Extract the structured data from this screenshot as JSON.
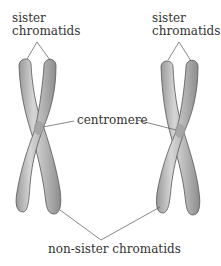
{
  "diagram": {
    "labels": {
      "sister_left_line1": "sister",
      "sister_left_line2": "chromatids",
      "sister_right_line1": "sister",
      "sister_right_line2": "chromatids",
      "centromere": "centromere",
      "non_sister": "non-sister chromatids"
    },
    "colors": {
      "chromatid_fill": "#a9a9a9",
      "chromatid_highlight": "#d8d8d8",
      "chromatid_outline": "#555555",
      "leader_line": "#555555",
      "text": "#333333",
      "background": "#ffffff"
    },
    "chromosomes": [
      {
        "name": "left-chromosome",
        "centromere": [
          40,
          128
        ]
      },
      {
        "name": "right-chromosome",
        "centromere": [
          180,
          130
        ]
      }
    ]
  }
}
